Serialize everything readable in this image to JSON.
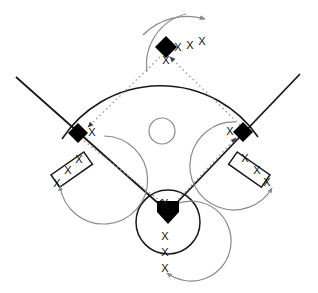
{
  "diagram": {
    "type": "baseball-field-rotation-drill",
    "colors": {
      "field_line": "#1a1a1a",
      "base_fill": "#000000",
      "arrow": "#8a8a8a",
      "base_path": "#9a9a9a",
      "mound": "#8a8a8a",
      "background": "#ffffff",
      "marker": "#111111"
    },
    "player_marker_glyph": "X"
  },
  "bases": [
    {
      "name": "second-base",
      "label": "",
      "shape": "diamond",
      "cx": 166,
      "cy": 47,
      "size": 11
    },
    {
      "name": "third-base",
      "label": "",
      "shape": "diamond",
      "cx": 78,
      "cy": 133,
      "size": 10
    },
    {
      "name": "first-base",
      "label": "",
      "shape": "diamond",
      "cx": 243,
      "cy": 132,
      "size": 10
    },
    {
      "name": "home-plate",
      "label": "",
      "shape": "pentagon",
      "cx": 168,
      "cy": 212,
      "size": 12
    }
  ],
  "mound": {
    "name": "pitchers-mound",
    "cx": 162,
    "cy": 131,
    "r": 13
  },
  "dugouts": [
    {
      "name": "third-base-dugout",
      "cx": 72,
      "cy": 170,
      "w": 40,
      "h": 15,
      "rotate": -35
    },
    {
      "name": "first-base-dugout",
      "cx": 249,
      "cy": 170,
      "w": 40,
      "h": 15,
      "rotate": 35
    }
  ],
  "player_markers": [
    {
      "group": "second-base",
      "x": 178,
      "y": 51
    },
    {
      "group": "second-base",
      "x": 190,
      "y": 49
    },
    {
      "group": "second-base",
      "x": 202,
      "y": 45
    },
    {
      "group": "second-base",
      "x": 166,
      "y": 64
    },
    {
      "group": "third-base",
      "x": 92,
      "y": 136
    },
    {
      "group": "third-base",
      "x": 79,
      "y": 163
    },
    {
      "group": "third-base",
      "x": 68,
      "y": 174
    },
    {
      "group": "third-base",
      "x": 57,
      "y": 187
    },
    {
      "group": "first-base",
      "x": 230,
      "y": 135
    },
    {
      "group": "first-base",
      "x": 245,
      "y": 162
    },
    {
      "group": "first-base",
      "x": 257,
      "y": 174
    },
    {
      "group": "first-base",
      "x": 267,
      "y": 186
    },
    {
      "group": "home-plate",
      "x": 165,
      "y": 207
    },
    {
      "group": "home-plate",
      "x": 165,
      "y": 240
    },
    {
      "group": "home-plate",
      "x": 165,
      "y": 256
    },
    {
      "group": "home-plate",
      "x": 165,
      "y": 272
    }
  ],
  "base_paths": [
    {
      "name": "home-to-first",
      "from": [
        168,
        212
      ],
      "to": [
        243,
        132
      ],
      "style": "dotted",
      "arrow": true
    },
    {
      "name": "first-to-second",
      "from": [
        243,
        132
      ],
      "to": [
        166,
        47
      ],
      "style": "dotted",
      "arrow": true
    },
    {
      "name": "second-to-third",
      "from": [
        166,
        47
      ],
      "to": [
        78,
        133
      ],
      "style": "dotted",
      "arrow": true
    },
    {
      "name": "third-to-home",
      "from": [
        78,
        133
      ],
      "to": [
        168,
        212
      ],
      "style": "dotted",
      "arrow": true
    }
  ],
  "foul_lines": [
    {
      "name": "left-foul-line",
      "from": [
        16,
        77
      ],
      "to": [
        168,
        212
      ]
    },
    {
      "name": "right-foul-line",
      "from": [
        300,
        74
      ],
      "to": [
        168,
        212
      ]
    }
  ],
  "outfield_fence": {
    "name": "outfield-fence-arc",
    "from": [
      62,
      139
    ],
    "to": [
      258,
      137
    ],
    "peak_y": 13
  },
  "rotation_arrows": [
    {
      "name": "second-base-rotation-arrow",
      "direction": "clockwise-right"
    },
    {
      "name": "third-base-rotation-arrow",
      "direction": "counterclockwise-down"
    },
    {
      "name": "first-base-rotation-arrow",
      "direction": "clockwise-down"
    },
    {
      "name": "home-plate-rotation-arrow",
      "direction": "clockwise-down"
    }
  ],
  "home_circle": {
    "name": "home-plate-circle",
    "cx": 168,
    "cy": 222,
    "r": 32
  }
}
